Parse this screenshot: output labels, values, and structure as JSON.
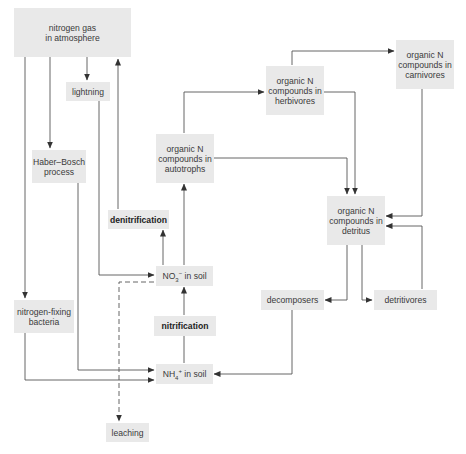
{
  "diagram": {
    "colors": {
      "box_fill": "#e9e9e9",
      "line": "#444444",
      "text": "#3a3a3a"
    },
    "nodes": {
      "atmosphere": {
        "label": "nitrogen gas\nin atmosphere"
      },
      "lightning": {
        "label": "lightning"
      },
      "haber_bosch": {
        "label": "Haber–Bosch\nprocess"
      },
      "autotrophs": {
        "label": "organic N\ncompounds in\nautotrophs"
      },
      "herbivores": {
        "label": "organic N\ncompounds in\nherbivores"
      },
      "carnivores": {
        "label": "organic N\ncompounds in\ncarnivores"
      },
      "denitrification": {
        "label": "denitrification"
      },
      "detritus": {
        "label": "organic N\ncompounds in\ndetritus"
      },
      "no3_soil": {
        "label_main": "NO",
        "label_sub": "3",
        "label_sup": "−",
        "label_tail": " in soil"
      },
      "decomposers": {
        "label": "decomposers"
      },
      "detritivores": {
        "label": "detritivores"
      },
      "nitrogen_fixing": {
        "label": "nitrogen-fixing\nbacteria"
      },
      "nitrification": {
        "label": "nitrification"
      },
      "nh4_soil": {
        "label_main": "NH",
        "label_sub": "4",
        "label_sup": "+",
        "label_tail": " in soil"
      },
      "leaching": {
        "label": "leaching"
      }
    },
    "edges": [
      {
        "from": "atmosphere",
        "to": "lightning",
        "style": "solid"
      },
      {
        "from": "atmosphere",
        "to": "haber_bosch",
        "style": "solid"
      },
      {
        "from": "atmosphere",
        "to": "nitrogen_fixing",
        "style": "solid"
      },
      {
        "from": "denitrification",
        "to": "atmosphere",
        "style": "solid"
      },
      {
        "from": "lightning",
        "to": "no3_soil",
        "style": "solid"
      },
      {
        "from": "haber_bosch",
        "to": "nh4_soil",
        "style": "solid"
      },
      {
        "from": "nitrogen_fixing",
        "to": "nh4_soil",
        "style": "solid"
      },
      {
        "from": "no3_soil",
        "to": "denitrification",
        "style": "solid"
      },
      {
        "from": "no3_soil",
        "to": "autotrophs",
        "style": "solid"
      },
      {
        "from": "no3_soil",
        "to": "leaching",
        "style": "dashed"
      },
      {
        "from": "nh4_soil",
        "to": "no3_soil",
        "via": "nitrification",
        "style": "solid"
      },
      {
        "from": "autotrophs",
        "to": "herbivores",
        "style": "solid"
      },
      {
        "from": "autotrophs",
        "to": "detritus",
        "style": "solid"
      },
      {
        "from": "herbivores",
        "to": "carnivores",
        "style": "solid"
      },
      {
        "from": "herbivores",
        "to": "detritus",
        "style": "solid"
      },
      {
        "from": "carnivores",
        "to": "detritus",
        "style": "solid"
      },
      {
        "from": "detritus",
        "to": "decomposers",
        "style": "solid"
      },
      {
        "from": "detritus",
        "to": "detritivores",
        "style": "solid"
      },
      {
        "from": "detritivores",
        "to": "detritus",
        "style": "solid"
      },
      {
        "from": "decomposers",
        "to": "nh4_soil",
        "style": "solid"
      }
    ]
  }
}
